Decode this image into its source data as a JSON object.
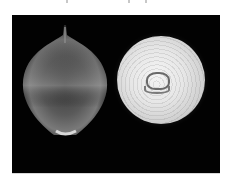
{
  "image": {
    "description": "Photograph on black background of a whole brown onion (left) and a sliced onion cross-section showing concentric rings (right)",
    "colors": {
      "page_background": "#ffffff",
      "photo_background": "#020202",
      "onion_skin_highlight": "#8c8c8c",
      "cut_onion_flesh": "#e6e6e6",
      "ring_lines": "#6a6a6a"
    },
    "subjects": [
      {
        "name": "whole-onion",
        "position": "left"
      },
      {
        "name": "cut-onion-cross-section",
        "position": "right"
      }
    ]
  }
}
